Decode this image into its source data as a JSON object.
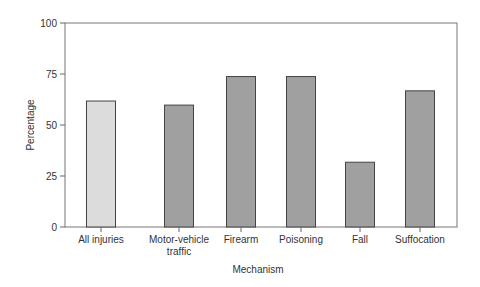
{
  "chart_data": {
    "type": "bar",
    "title": "",
    "xlabel": "Mechanism",
    "ylabel": "Percentage",
    "ylim": [
      0,
      100
    ],
    "yticks": [
      0,
      25,
      50,
      75,
      100
    ],
    "grid": false,
    "legend": null,
    "categories": [
      "All injuries",
      "Motor-vehicle traffic",
      "Firearm",
      "Poisoning",
      "Fall",
      "Suffocation"
    ],
    "category_label_lines": [
      [
        "All injuries"
      ],
      [
        "Motor-vehicle",
        "traffic"
      ],
      [
        "Firearm"
      ],
      [
        "Poisoning"
      ],
      [
        "Fall"
      ],
      [
        "Suffocation"
      ]
    ],
    "values": [
      62,
      60,
      74,
      74,
      32,
      67
    ],
    "bar_colors": [
      "#dcdcdc",
      "#a0a0a0",
      "#a0a0a0",
      "#a0a0a0",
      "#a0a0a0",
      "#a0a0a0"
    ],
    "bar_edge_color": "#444444"
  },
  "layout": {
    "plot_left": 65,
    "plot_right": 457,
    "plot_top": 23,
    "plot_bottom": 227,
    "bar_x": [
      86,
      164,
      226,
      286,
      345,
      405
    ],
    "bar_width": 29
  }
}
